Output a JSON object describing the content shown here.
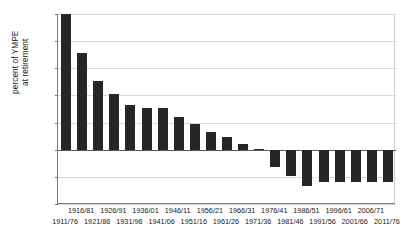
{
  "chart_data": {
    "type": "bar",
    "title": "",
    "xlabel": "",
    "ylabel": "percent of YMPE\nat retirement",
    "ylim": [
      -200,
      500
    ],
    "ytick_values": [
      500,
      400,
      300,
      200,
      100,
      0,
      -100,
      -200
    ],
    "ytick_labels": [
      "500",
      "400",
      "300",
      "200",
      "100",
      "0",
      "-100",
      "-200"
    ],
    "grid": true,
    "legend": "none",
    "categories": [
      "1911/76",
      "1916/81",
      "1921/86",
      "1926/91",
      "1931/96",
      "1936/01",
      "1941/06",
      "1946/11",
      "1951/16",
      "1956/21",
      "1961/26",
      "1966/31",
      "1971/36",
      "1976/41",
      "1981/46",
      "1986/51",
      "1991/56",
      "1996/61",
      "2001/66",
      "2006/71",
      "2011/76"
    ],
    "values": [
      500,
      355,
      252,
      204,
      163,
      152,
      152,
      122,
      96,
      67,
      48,
      22,
      2,
      -63,
      -96,
      -133,
      -120,
      -120,
      -120,
      -120,
      -120
    ],
    "bar_color": "#262626",
    "axis_color": "#7a7a7a",
    "grid_color": "#d9d9d9"
  }
}
